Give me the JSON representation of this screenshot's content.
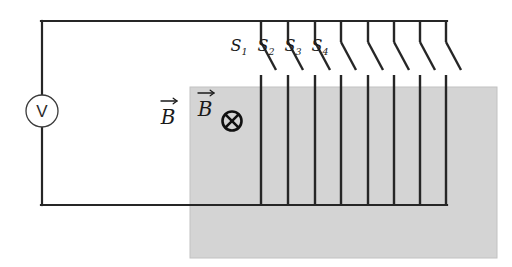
{
  "figure": {
    "background_color": "#ffffff",
    "wire_color": "#262626",
    "shaded_region_color": "#d4d4d4",
    "shaded_region_border_color": "#bfbfbf"
  },
  "meter": {
    "name": "voltmeter",
    "label": "V",
    "cx": 42,
    "cy": 111,
    "r": 16
  },
  "field_labels": {
    "outside": {
      "symbol": "B",
      "vector_arrow": true,
      "x": 168,
      "y": 124
    },
    "inside": {
      "symbol": "B",
      "vector_arrow": true,
      "x": 205,
      "y": 116
    },
    "direction_marker": {
      "name": "field-into-page",
      "glyph": "circle-cross",
      "cx": 232,
      "cy": 121,
      "r": 9.5
    }
  },
  "circuit": {
    "left_rail_x": 42,
    "top_rail_y": 21,
    "bottom_rail_y": 205,
    "top_rail_left_x": 42,
    "top_rail_right_x": 446,
    "bottom_rail_right_x": 446
  },
  "shaded_region": {
    "x": 190,
    "y": 87,
    "width": 307,
    "height": 171
  },
  "switches": [
    {
      "id": "S1",
      "label": "S",
      "subscript": "1",
      "wire_x": 261,
      "label_x": 239,
      "label_y": 51,
      "has_label": true
    },
    {
      "id": "S2",
      "label": "S",
      "subscript": "2",
      "wire_x": 288,
      "label_x": 266,
      "label_y": 51,
      "has_label": true
    },
    {
      "id": "S3",
      "label": "S",
      "subscript": "3",
      "wire_x": 315,
      "label_x": 293,
      "label_y": 51,
      "has_label": true
    },
    {
      "id": "S4",
      "label": "S",
      "subscript": "4",
      "wire_x": 341,
      "label_x": 320,
      "label_y": 51,
      "has_label": true
    },
    {
      "id": "S5",
      "label": "",
      "subscript": "",
      "wire_x": 368,
      "label_x": 0,
      "label_y": 0,
      "has_label": false
    },
    {
      "id": "S6",
      "label": "",
      "subscript": "",
      "wire_x": 394,
      "label_x": 0,
      "label_y": 0,
      "has_label": false
    },
    {
      "id": "S7",
      "label": "",
      "subscript": "",
      "wire_x": 420,
      "label_x": 0,
      "label_y": 0,
      "has_label": false
    },
    {
      "id": "S8",
      "label": "",
      "subscript": "",
      "wire_x": 446,
      "label_x": 0,
      "label_y": 0,
      "has_label": false
    }
  ],
  "switch_geometry": {
    "pivot_y": 21,
    "blade_start_y": 42,
    "blade_end_dx": 15,
    "blade_end_y": 70,
    "contact_top_y": 75,
    "contact_bottom_y": 205
  }
}
